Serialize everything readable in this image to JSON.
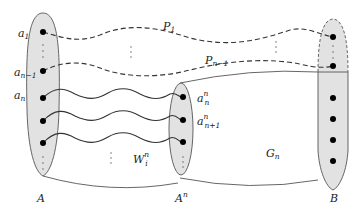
{
  "colors": {
    "set_fill": "#e2e2e2",
    "set_stroke": "#555555",
    "path_stroke": "#333333",
    "vertex": "#000000",
    "background": "#ffffff"
  },
  "sets": {
    "A": {
      "label": "A"
    },
    "An": {
      "label": "A",
      "sup": "n"
    },
    "B": {
      "label": "B"
    }
  },
  "vertices_A": {
    "a1": {
      "label": "a",
      "sub": "1"
    },
    "an_minus_1": {
      "label": "a",
      "sub": "n−1"
    },
    "an": {
      "label": "a",
      "sub": "n"
    }
  },
  "vertices_An": {
    "ann": {
      "label": "a",
      "sub": "n",
      "sup": "n"
    },
    "an1n": {
      "label": "a",
      "sub": "n+1",
      "sup": "n"
    }
  },
  "paths": {
    "P1": {
      "label": "P",
      "sub": "1",
      "style": "dashed"
    },
    "Pn1": {
      "label": "P",
      "sub": "n−1",
      "style": "dashed"
    }
  },
  "linkage": {
    "label": "W",
    "sub": "i",
    "sup": "n",
    "style": "wavy",
    "count_shown": 3
  },
  "region": {
    "label": "G",
    "sub": "n"
  },
  "ellipsis": "⋮"
}
